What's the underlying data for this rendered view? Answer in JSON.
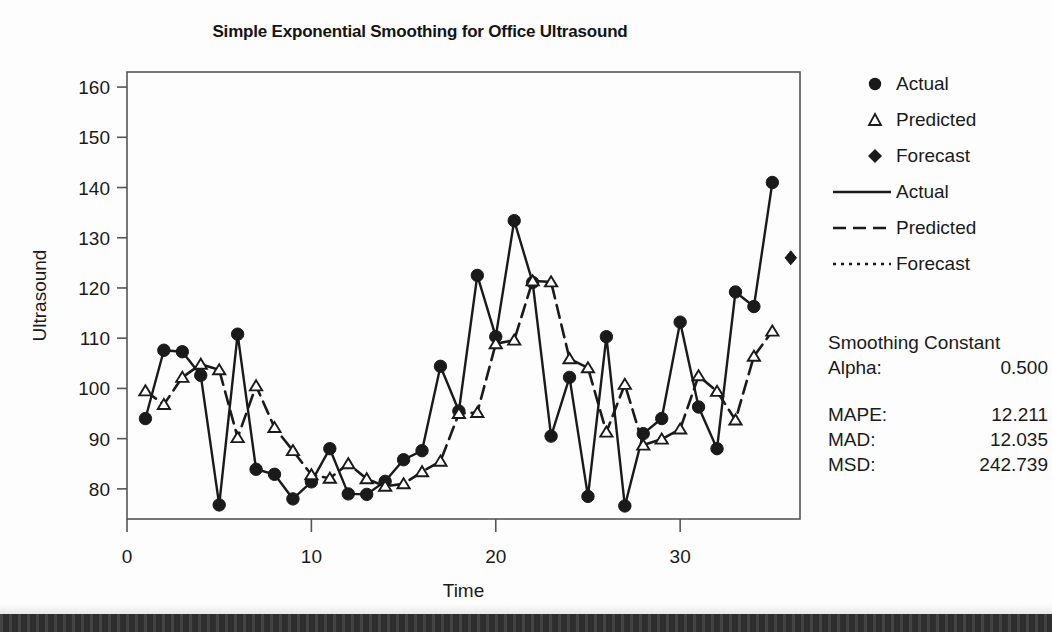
{
  "chart_data": {
    "type": "line",
    "title": "Simple Exponential Smoothing for Office Ultrasound",
    "xlabel": "Time",
    "ylabel": "Ultrasound",
    "xlim": [
      0,
      36.5
    ],
    "ylim": [
      74,
      163
    ],
    "xticks": [
      0,
      10,
      20,
      30
    ],
    "yticks": [
      80,
      90,
      100,
      110,
      120,
      130,
      140,
      150,
      160
    ],
    "grid": false,
    "legend_position": "right",
    "x": [
      1,
      2,
      3,
      4,
      5,
      6,
      7,
      8,
      9,
      10,
      11,
      12,
      13,
      14,
      15,
      16,
      17,
      18,
      19,
      20,
      21,
      22,
      23,
      24,
      25,
      26,
      27,
      28,
      29,
      30,
      31,
      32,
      33,
      34,
      35
    ],
    "series": [
      {
        "name": "Actual",
        "marker": "circle",
        "linestyle": "solid",
        "values": [
          94.0,
          107.6,
          107.3,
          102.6,
          76.8,
          110.8,
          83.9,
          82.9,
          78.0,
          81.4,
          88.0,
          79.0,
          78.9,
          81.5,
          85.8,
          87.6,
          104.4,
          95.5,
          122.5,
          110.3,
          133.4,
          121.1,
          90.5,
          102.2,
          78.5,
          110.3,
          76.6,
          91.0,
          94.0,
          113.2,
          96.3,
          88.0,
          119.2,
          116.3,
          141.0
        ]
      },
      {
        "name": "Predicted",
        "marker": "triangle",
        "linestyle": "dashed",
        "values": [
          99.5,
          96.8,
          102.2,
          104.8,
          103.7,
          90.2,
          100.5,
          92.2,
          87.6,
          82.8,
          82.1,
          85.0,
          82.0,
          80.5,
          81.0,
          83.4,
          85.5,
          95.0,
          95.2,
          108.9,
          109.6,
          121.4,
          121.2,
          105.9,
          104.1,
          91.3,
          100.8,
          88.7,
          89.9,
          91.9,
          102.5,
          99.4,
          93.7,
          106.4,
          111.4
        ]
      }
    ],
    "forecast": {
      "name": "Forecast",
      "marker": "diamond",
      "linestyle": "dotted",
      "x": [
        36
      ],
      "values": [
        126.0
      ]
    }
  },
  "legend": {
    "items": [
      {
        "label": "Actual",
        "symbol": "circle"
      },
      {
        "label": "Predicted",
        "symbol": "triangle"
      },
      {
        "label": "Forecast",
        "symbol": "diamond"
      },
      {
        "label": "Actual",
        "symbol": "line-solid"
      },
      {
        "label": "Predicted",
        "symbol": "line-dashed"
      },
      {
        "label": "Forecast",
        "symbol": "line-dotted"
      }
    ]
  },
  "stats": {
    "smoothing_header": "Smoothing Constant",
    "alpha_key": "Alpha:",
    "alpha_value": "0.500",
    "rows": [
      {
        "key": "MAPE:",
        "value": "12.211"
      },
      {
        "key": "MAD:",
        "value": "12.035"
      },
      {
        "key": "MSD:",
        "value": "242.739"
      }
    ]
  },
  "colors": {
    "ink": "#1a1a1a",
    "frame": "#555555",
    "band": "#2e2e2e"
  }
}
